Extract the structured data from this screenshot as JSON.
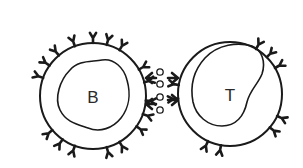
{
  "diagram": {
    "type": "cell-interaction",
    "colors": {
      "stroke": "#1a1a1a",
      "background": "#ffffff"
    },
    "cells": [
      {
        "id": "b-cell",
        "label": "B",
        "center": [
          93,
          96
        ],
        "radius": 53,
        "receptor_angles": [
          200,
          215,
          230,
          250,
          270,
          285,
          300,
          330,
          345,
          5,
          20,
          35,
          110,
          125,
          140,
          60,
          75
        ],
        "label_pos": [
          93,
          103
        ]
      },
      {
        "id": "t-cell",
        "label": "T",
        "center": [
          230,
          94
        ],
        "radius": 52,
        "receptor_angles": [
          300,
          315,
          330,
          25,
          40,
          100,
          115,
          190,
          175
        ],
        "label_pos": [
          230,
          101
        ]
      }
    ],
    "antigens": [
      {
        "x": 160,
        "y": 72
      },
      {
        "x": 160,
        "y": 84
      },
      {
        "x": 160,
        "y": 97
      },
      {
        "x": 160,
        "y": 110
      }
    ]
  }
}
